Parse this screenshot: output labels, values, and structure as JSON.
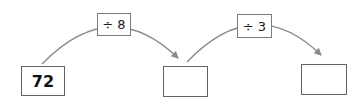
{
  "diagram": {
    "start": {
      "value": "72"
    },
    "steps": [
      {
        "operation": "÷ 8",
        "result": ""
      },
      {
        "operation": "÷ 3",
        "result": ""
      }
    ],
    "colors": {
      "background": "#ffffff",
      "arrow": "#8a8a8a",
      "box_border": "#636363",
      "label_border": "#7c7c7c",
      "text": "#111111"
    }
  }
}
